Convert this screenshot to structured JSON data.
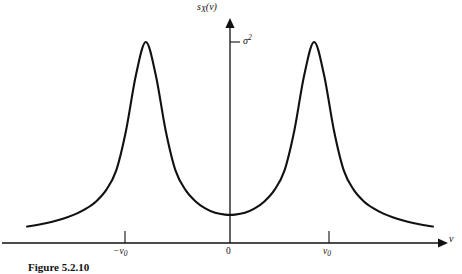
{
  "figure": {
    "caption": "Figure 5.2.10",
    "background_color": "#ffffff",
    "ink_color": "#111111"
  },
  "axes": {
    "y_axis_title": "s",
    "y_axis_title_sub": "X",
    "y_axis_title_arg": "(ν)",
    "x_axis_title": "ν",
    "y_tick_label": "σ",
    "y_tick_label_sup": "2",
    "x_ticks": [
      {
        "label_prefix": "−ν",
        "label_sub": "0"
      },
      {
        "label_prefix": "0",
        "label_sub": ""
      },
      {
        "label_prefix": "ν",
        "label_sub": "0"
      }
    ]
  },
  "chart_data": {
    "type": "line",
    "title": "",
    "subtitle": "",
    "xlabel": "ν",
    "ylabel": "s_X(ν)",
    "grid": false,
    "legend": null,
    "annotations": [
      {
        "text": "σ²",
        "kind": "y-tick",
        "y": 1.0
      },
      {
        "text": "−ν₀",
        "kind": "x-tick",
        "x": -1.0
      },
      {
        "text": "0",
        "kind": "x-tick",
        "x": 0.0
      },
      {
        "text": "ν₀",
        "kind": "x-tick",
        "x": 1.0
      }
    ],
    "xlim": [
      -2.05,
      2.05
    ],
    "ylim": [
      0,
      1.12
    ],
    "series": [
      {
        "name": "s_X(ν)",
        "color": "#111111",
        "x": [
          -2.05,
          -1.95,
          -1.85,
          -1.75,
          -1.65,
          -1.55,
          -1.45,
          -1.35,
          -1.25,
          -1.15,
          -1.05,
          -0.95,
          -0.85,
          -0.75,
          -0.65,
          -0.55,
          -0.45,
          -0.35,
          -0.25,
          -0.15,
          -0.05,
          0.05,
          0.15,
          0.25,
          0.35,
          0.45,
          0.55,
          0.65,
          0.75,
          0.85,
          0.95,
          1.05,
          1.15,
          1.25,
          1.35,
          1.45,
          1.55,
          1.65,
          1.75,
          1.85,
          1.95,
          2.05
        ],
        "y": [
          0.082,
          0.09,
          0.1,
          0.112,
          0.127,
          0.146,
          0.172,
          0.208,
          0.264,
          0.36,
          0.56,
          0.836,
          1.0,
          0.836,
          0.56,
          0.36,
          0.264,
          0.208,
          0.172,
          0.15,
          0.141,
          0.141,
          0.15,
          0.172,
          0.208,
          0.264,
          0.36,
          0.56,
          0.836,
          1.0,
          0.836,
          0.56,
          0.36,
          0.264,
          0.208,
          0.172,
          0.146,
          0.127,
          0.112,
          0.1,
          0.09,
          0.082
        ]
      }
    ],
    "peaks": [
      {
        "x": -1.0,
        "y": 1.0,
        "label": "−ν₀"
      },
      {
        "x": 1.0,
        "y": 1.0,
        "label": "ν₀"
      }
    ],
    "valley": {
      "x": 0.0,
      "y": 0.155
    }
  }
}
